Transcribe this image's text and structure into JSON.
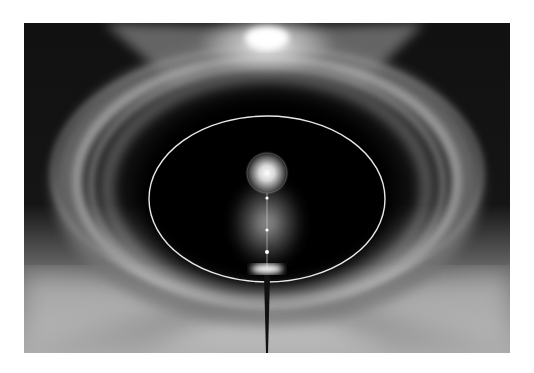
{
  "image": {
    "description": "Abstract grayscale light art: glowing elliptical rings around a dark center with a bright orb, a vertical beam and a starburst at the top",
    "palette": {
      "dark": "#0a0a0a",
      "light": "#ffffff",
      "mid": "#9a9a9a"
    }
  }
}
